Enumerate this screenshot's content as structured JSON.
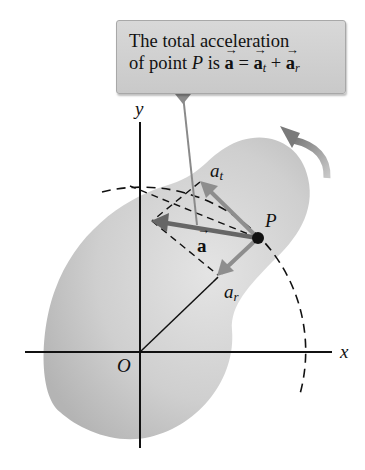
{
  "callout": {
    "line1": "The total acceleration",
    "line2_prefix": "of point ",
    "line2_point": "P",
    "line2_is": " is ",
    "vec_a": "a",
    "equals": " = ",
    "vec_at": "a",
    "sub_t": "t",
    "plus": " + ",
    "vec_ar": "a",
    "sub_r": "r"
  },
  "labels": {
    "y_axis": "y",
    "x_axis": "x",
    "origin": "O",
    "point": "P",
    "a_t_base": "a",
    "a_t_sub": "t",
    "a_r_base": "a",
    "a_r_sub": "r",
    "a_vec": "a"
  },
  "colors": {
    "body_fill": "#c4c4c4",
    "vector": "#6e6e6e",
    "vector_light": "#8e8e8e",
    "rotation_arrow": "#8a8a8a",
    "axes": "#111111"
  },
  "geometry": {
    "origin": [
      140,
      352
    ],
    "point_P": [
      258,
      238
    ],
    "a_tip": [
      152,
      221
    ],
    "a_t_tip": [
      200,
      182
    ],
    "a_r_tip": [
      218,
      275
    ],
    "circle_radius": 164
  }
}
